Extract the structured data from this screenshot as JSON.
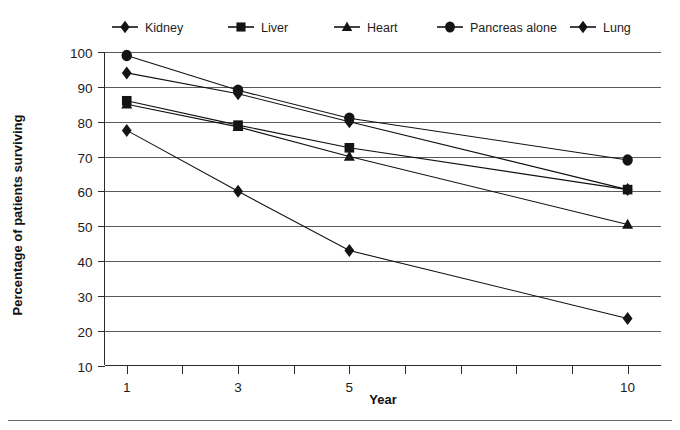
{
  "chart_data": {
    "type": "line",
    "title": "",
    "xlabel": "Year",
    "ylabel": "Percentage of patients surviving",
    "x": [
      1,
      3,
      5,
      10
    ],
    "xtick_labels": [
      "1",
      "3",
      "5",
      "10"
    ],
    "xtick_all": [
      1,
      2,
      3,
      4,
      5,
      6,
      7,
      8,
      9,
      10
    ],
    "xlim": [
      0.6,
      10.6
    ],
    "ylim": [
      10,
      100
    ],
    "ytick_labels": [
      "10",
      "20",
      "30",
      "40",
      "50",
      "60",
      "70",
      "80",
      "90",
      "100"
    ],
    "ytick_values": [
      10,
      20,
      30,
      40,
      50,
      60,
      70,
      80,
      90,
      100
    ],
    "grid": true,
    "legend_position": "top",
    "series": [
      {
        "name": "Kidney",
        "marker": "diamond",
        "values": [
          94,
          88,
          80,
          60.5
        ]
      },
      {
        "name": "Liver",
        "marker": "square",
        "values": [
          86,
          79,
          72.5,
          60.5
        ]
      },
      {
        "name": "Heart",
        "marker": "triangle",
        "values": [
          85,
          78.5,
          70,
          50.5
        ]
      },
      {
        "name": "Pancreas alone",
        "marker": "circle",
        "values": [
          99,
          89,
          81,
          69
        ]
      },
      {
        "name": "Lung",
        "marker": "diamond",
        "values": [
          77.5,
          60,
          43,
          23.5
        ]
      }
    ]
  },
  "legend": {
    "items": [
      {
        "label": "Kidney",
        "marker": "diamond"
      },
      {
        "label": "Liver",
        "marker": "square"
      },
      {
        "label": "Heart",
        "marker": "triangle"
      },
      {
        "label": "Pancreas alone",
        "marker": "circle"
      },
      {
        "label": "Lung",
        "marker": "diamond"
      }
    ]
  },
  "axes": {
    "x_title": "Year",
    "y_title": "Percentage of patients surviving"
  }
}
